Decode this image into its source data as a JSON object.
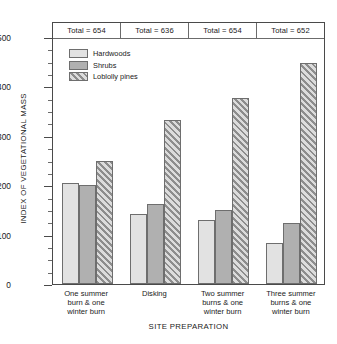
{
  "chart_data": {
    "type": "bar",
    "title": "",
    "xlabel": "SITE PREPARATION",
    "ylabel": "INDEX OF VEGETATIONAL MASS",
    "ylim": [
      0,
      500
    ],
    "y_major_step": 100,
    "y_minor_step": 25,
    "grid": false,
    "legend_position": "top-left inside plot",
    "categories": [
      "One summer burn & one winter burn",
      "Disking",
      "Two summer burns & one winter burn",
      "Three summer burns & one winter burn"
    ],
    "category_lines": [
      [
        "One summer",
        "burn & one",
        "winter burn"
      ],
      [
        "Disking"
      ],
      [
        "Two summer",
        "burns & one",
        "winter burn"
      ],
      [
        "Three summer",
        "burns & one",
        "winter burn"
      ]
    ],
    "series": [
      {
        "name": "Hardwoods",
        "values": [
          205,
          141,
          130,
          83
        ]
      },
      {
        "name": "Shrubs",
        "values": [
          200,
          162,
          150,
          123
        ]
      },
      {
        "name": "Loblolly pines",
        "values": [
          250,
          332,
          376,
          448
        ]
      }
    ],
    "y_ticks": [
      {
        "value": 0,
        "label": "0"
      },
      {
        "value": 100,
        "label": "100"
      },
      {
        "value": 200,
        "label": "200"
      },
      {
        "value": 300,
        "label": "300"
      },
      {
        "value": 400,
        "label": "400"
      },
      {
        "value": 500,
        "label": "500"
      }
    ],
    "totals": [
      "Total = 654",
      "Total = 636",
      "Total = 654",
      "Total = 652"
    ],
    "totals_values": [
      654,
      636,
      654,
      652
    ],
    "annotations": []
  },
  "style": {
    "hardwoods_color": "#e2e2e2",
    "shrubs_color": "#b0b0b0",
    "pines_color": "#cfcfcf",
    "pines_hatch_color": "#8d8d8d",
    "border_color": "#6e6e6e",
    "frame_color": "#4a4a4a",
    "background": "#ffffff"
  }
}
